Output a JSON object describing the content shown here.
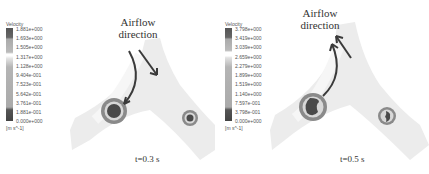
{
  "panels": [
    {
      "id": "t03",
      "time_label": "t=0.3 s",
      "annotation": [
        "Airflow",
        "direction"
      ],
      "legend": {
        "title": "Velocity",
        "ticks": [
          "1.881e+000",
          "1.693e+000",
          "1.505e+000",
          "1.317e+000",
          "1.128e+000",
          "9.404e-001",
          "7.523e-001",
          "5.642e-001",
          "3.761e-001",
          "1.881e-001",
          "0.000e+000"
        ],
        "unit": "[m s^-1]"
      }
    },
    {
      "id": "t05",
      "time_label": "t=0.5 s",
      "annotation": [
        "Airflow",
        "direction"
      ],
      "legend": {
        "title": "Velocity",
        "ticks": [
          "3.798e+000",
          "3.419e+000",
          "3.039e+000",
          "2.659e+000",
          "2.279e+000",
          "1.899e+000",
          "1.519e+000",
          "1.140e+000",
          "7.597e-001",
          "3.798e-001",
          "0.000e+000"
        ],
        "unit": "[m s^-1]"
      }
    }
  ],
  "colors": {
    "airway": "#ececec",
    "ring_outer": "#8a8a8a",
    "ring_inner": "#d8d8d8",
    "core": "#4a4a4a",
    "arrow": "#3a3a3a"
  }
}
